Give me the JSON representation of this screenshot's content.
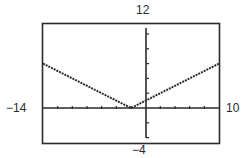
{
  "chart_data": {
    "type": "line",
    "title": "",
    "xlabel": "",
    "ylabel": "",
    "window": {
      "xmin": -14,
      "xmax": 10,
      "ymin": -4,
      "ymax": 12
    },
    "tick_labels": {
      "ymax": "12",
      "ymin": "−4",
      "xmin": "−14",
      "xmax": "10"
    },
    "xlim": [
      -14,
      10
    ],
    "ylim": [
      -4,
      12
    ],
    "grid": false,
    "legend": null,
    "series": [
      {
        "name": "absolute value graph (V shape)",
        "style": "dotted",
        "x": [
          -14,
          -2,
          -1,
          10
        ],
        "y": [
          6,
          0,
          0.5,
          6
        ]
      }
    ]
  }
}
